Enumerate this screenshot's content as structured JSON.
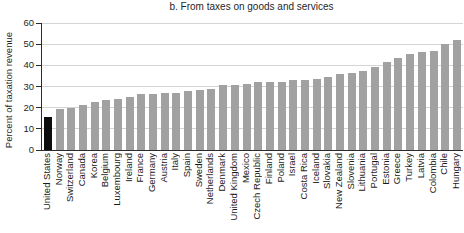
{
  "figure": {
    "title": "b. From taxes on goods and services"
  },
  "chart_data": {
    "type": "bar",
    "title": "b. From taxes on goods and services",
    "xlabel": "",
    "ylabel": "Percent of taxation revenue",
    "ylim": [
      0,
      60
    ],
    "yticks": [
      0,
      10,
      20,
      30,
      40,
      50,
      60
    ],
    "grid": true,
    "legend": "none",
    "highlight_index": 0,
    "categories": [
      "United States",
      "Norway",
      "Switzerland",
      "Canada",
      "Korea",
      "Belgium",
      "Luxembourg",
      "Ireland",
      "France",
      "Germany",
      "Austria",
      "Italy",
      "Spain",
      "Sweden",
      "Netherlands",
      "Denmark",
      "United Kingdom",
      "Mexico",
      "Czech Republic",
      "Finland",
      "Poland",
      "Israel",
      "Costa Rica",
      "Iceland",
      "Slovakia",
      "New Zealand",
      "Slovenia",
      "Lithuania",
      "Portugal",
      "Estonia",
      "Greece",
      "Turkey",
      "Latvia",
      "Colombia",
      "Chile",
      "Hungary"
    ],
    "values": [
      15.5,
      19.5,
      20,
      21.5,
      22.5,
      23.5,
      24,
      25,
      26.5,
      26.5,
      27,
      27,
      28,
      28.5,
      29,
      30.5,
      30.5,
      31,
      32,
      32,
      32,
      33,
      33,
      33.5,
      34.5,
      36,
      36.5,
      37.5,
      39,
      41.5,
      43.5,
      45.5,
      46.5,
      47,
      50,
      52
    ],
    "colors": {
      "bar": "#a1a1a1",
      "highlight": "#0d0d0d",
      "gridline": "#d4d4d4",
      "axis": "#2b2b2b",
      "text": "#1a1a1a"
    }
  }
}
